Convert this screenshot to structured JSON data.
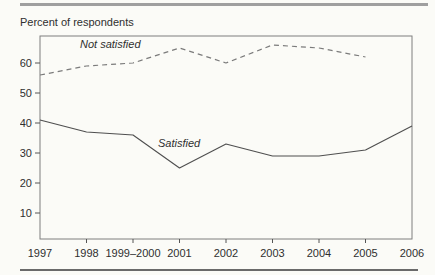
{
  "page": {
    "title": "Percent of respondents"
  },
  "colors": {
    "background": "#fbfbf7",
    "frame": "#7f7f7f",
    "text": "#2f2f2f",
    "tick": "#555555",
    "top_rule": "#9f9f9f",
    "bottom_rule": "#6a6a6a"
  },
  "chart_data": {
    "type": "line",
    "title": "Percent of respondents",
    "categories": [
      "1997",
      "1998",
      "1999–2000",
      "2001",
      "2002",
      "2003",
      "2004",
      "2005",
      "2006"
    ],
    "series": [
      {
        "name": "Not satisfied",
        "line_style": "dashed",
        "color": "#7b7b7b",
        "values": [
          56,
          59,
          60,
          65,
          60,
          66,
          65,
          62,
          null
        ]
      },
      {
        "name": "Satisfied",
        "line_style": "solid",
        "color": "#4f4f4f",
        "values": [
          41,
          37,
          36,
          25,
          33,
          29,
          29,
          31,
          39
        ]
      }
    ],
    "yticks": [
      10,
      20,
      30,
      40,
      50,
      60
    ],
    "ylim": [
      0,
      69
    ],
    "xlabel": "",
    "ylabel": "",
    "grid": false,
    "legend_position": "inline-labels"
  }
}
